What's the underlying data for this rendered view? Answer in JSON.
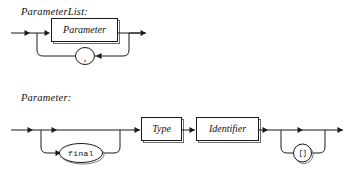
{
  "page": {
    "kind": "railroad-syntax-diagram",
    "background_color": "#ffffff",
    "line_color": "#1a1a1a",
    "box_shadow_color": "#6e6e6e"
  },
  "diagrams": [
    {
      "id": "parameter-list",
      "title": "ParameterList:",
      "title_text": "ParameterList",
      "nodes": [
        {
          "name": "parameter",
          "label": "Parameter",
          "shape": "box",
          "kind": "nonterminal"
        },
        {
          "name": "comma",
          "label": ",",
          "shape": "oval",
          "kind": "terminal"
        }
      ],
      "loop": {
        "name": "comma-repeat-loop",
        "separator": ",",
        "direction": "right-to-left"
      }
    },
    {
      "id": "parameter",
      "title": "Parameter:",
      "title_text": "Parameter",
      "nodes": [
        {
          "name": "final",
          "label": "final",
          "shape": "oval",
          "kind": "terminal",
          "optional": true
        },
        {
          "name": "type",
          "label": "Type",
          "shape": "box",
          "kind": "nonterminal"
        },
        {
          "name": "identifier",
          "label": "Identifier",
          "shape": "box",
          "kind": "nonterminal"
        },
        {
          "name": "brackets",
          "label": "[]",
          "shape": "oval",
          "kind": "terminal",
          "optional": true,
          "repeatable": true
        }
      ],
      "loop": {
        "name": "brackets-repeat-loop",
        "separator": "[]",
        "direction": "right-to-left"
      }
    }
  ]
}
